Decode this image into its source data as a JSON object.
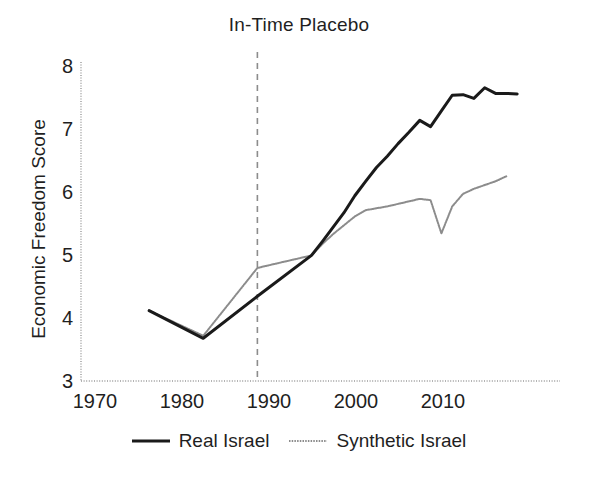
{
  "chart_data": {
    "type": "line",
    "title": "In-Time Placebo",
    "xlabel": "",
    "ylabel": "Economic Freedom Score",
    "xlim": [
      1967,
      2012
    ],
    "ylim": [
      3,
      8
    ],
    "xticks": [
      "1970",
      "1980",
      "1990",
      "2000",
      "2010"
    ],
    "xtick_values": [
      1970,
      1980,
      1990,
      2000,
      2010
    ],
    "yticks": [
      "3",
      "4",
      "5",
      "6",
      "7",
      "8"
    ],
    "ytick_values": [
      3,
      4,
      5,
      6,
      7,
      8
    ],
    "grid": false,
    "legend_position": "bottom",
    "annotations": [
      {
        "name": "placebo-treatment-year",
        "type": "vline",
        "x": 1985,
        "style": "dashed",
        "color": "#8c8c8c"
      }
    ],
    "series": [
      {
        "name": "Real Israel",
        "color": "#1a1a1a",
        "style": "solid",
        "width": 3.0,
        "x": [
          1975,
          1980,
          1985,
          1990,
          1991,
          1992,
          1993,
          1994,
          1995,
          1996,
          1997,
          1998,
          1999,
          2000,
          2001,
          2002,
          2003,
          2004,
          2005,
          2006,
          2007,
          2008,
          2009
        ],
        "y": [
          4.12,
          3.68,
          4.35,
          5.0,
          5.22,
          5.45,
          5.68,
          5.95,
          6.18,
          6.4,
          6.58,
          6.78,
          6.96,
          7.15,
          7.05,
          7.3,
          7.55,
          7.56,
          7.5,
          7.67,
          7.58,
          7.58,
          7.57
        ]
      },
      {
        "name": "Synthetic Israel",
        "color": "#8c8c8c",
        "style": "dotted",
        "width": 2.0,
        "x": [
          1975,
          1980,
          1985,
          1990,
          1991,
          1992,
          1993,
          1994,
          1995,
          1996,
          1997,
          1998,
          1999,
          2000,
          2001,
          2002,
          2003,
          2004,
          2005,
          2006,
          2007,
          2008
        ],
        "y": [
          4.12,
          3.72,
          4.8,
          5.0,
          5.18,
          5.34,
          5.48,
          5.62,
          5.72,
          5.75,
          5.78,
          5.82,
          5.86,
          5.9,
          5.88,
          5.35,
          5.78,
          5.98,
          6.06,
          6.12,
          6.18,
          6.26
        ]
      }
    ]
  },
  "legend": {
    "items": [
      {
        "label": "Real Israel",
        "color": "#1a1a1a",
        "style": "solid"
      },
      {
        "label": "Synthetic Israel",
        "color": "#8c8c8c",
        "style": "dotted"
      }
    ]
  },
  "axes": {
    "y_axis_color": "#9a9a9a",
    "x_axis_color": "#9a9a9a"
  }
}
